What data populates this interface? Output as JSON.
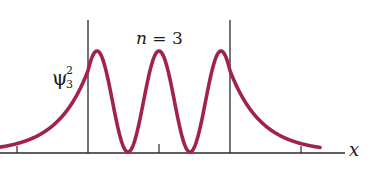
{
  "figure": {
    "state_label_var": "n",
    "state_label_eq": " = 3",
    "y_label_main": "ψ",
    "y_label_sup": "2",
    "y_label_sub": "3",
    "x_label": "x",
    "curve_color": "#A3224B",
    "axis_color": "#2a2a2a"
  },
  "chart_data": {
    "type": "line",
    "title": "n = 3",
    "xlabel": "x",
    "ylabel": "ψ₃²",
    "well_walls_x_px": [
      88,
      230
    ],
    "tick_marks_x_px": [
      17,
      159,
      301
    ],
    "peaks_x_px": [
      98,
      159,
      219
    ],
    "nodes_x_px": [
      128,
      189
    ],
    "peak_relative_height": 1.0,
    "wall_relative_height": 0.76,
    "grid": false,
    "legend": null
  }
}
